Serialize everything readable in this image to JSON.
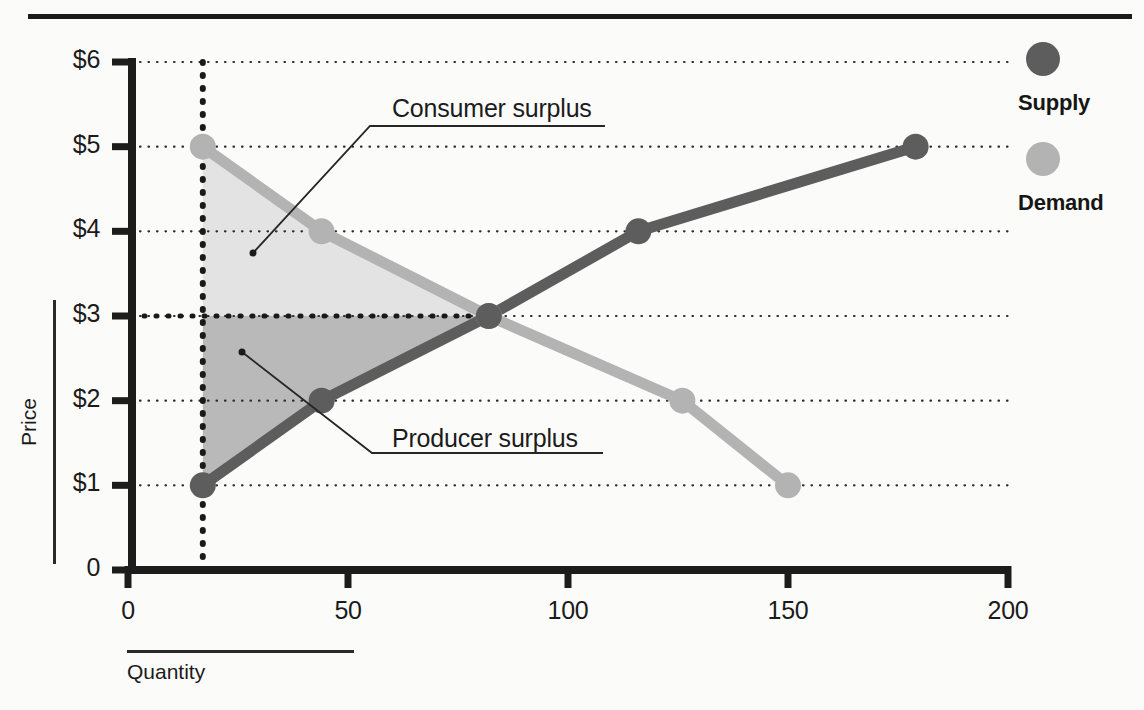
{
  "chart_data": {
    "type": "line",
    "title": "",
    "xlabel": "Quantity",
    "ylabel": "Price",
    "xlim": [
      0,
      200
    ],
    "ylim": [
      0,
      6
    ],
    "xticks": [
      "0",
      "50",
      "100",
      "150",
      "200"
    ],
    "xtick_values": [
      0,
      50,
      100,
      150,
      200
    ],
    "yticks": [
      "0",
      "$1",
      "$2",
      "$3",
      "$4",
      "$5",
      "$6"
    ],
    "ytick_values": [
      0,
      1,
      2,
      3,
      4,
      5,
      6
    ],
    "grid": "horizontal-dotted",
    "legend_position": "right",
    "series": [
      {
        "name": "Supply",
        "color": "#5d5d5d",
        "points": [
          {
            "q": 17,
            "p": 1
          },
          {
            "q": 44,
            "p": 2
          },
          {
            "q": 82,
            "p": 3
          },
          {
            "q": 116,
            "p": 4
          },
          {
            "q": 179,
            "p": 5
          }
        ]
      },
      {
        "name": "Demand",
        "color": "#b3b3b3",
        "points": [
          {
            "q": 17,
            "p": 5
          },
          {
            "q": 44,
            "p": 4
          },
          {
            "q": 82,
            "p": 3
          },
          {
            "q": 126,
            "p": 2
          },
          {
            "q": 150,
            "p": 1
          }
        ]
      }
    ],
    "equilibrium": {
      "q": 82,
      "p": 3
    },
    "regions": [
      {
        "name": "Consumer surplus",
        "color": "#e3e3e3"
      },
      {
        "name": "Producer surplus",
        "color": "#b9b9b9"
      }
    ],
    "reference_lines": [
      {
        "name": "equilibrium-price-line",
        "orientation": "horizontal",
        "value": 3,
        "style": "dotted"
      },
      {
        "name": "left-boundary-line",
        "orientation": "vertical",
        "value": 17,
        "style": "dotted"
      }
    ]
  },
  "annotations": {
    "consumer_surplus": "Consumer surplus",
    "producer_surplus": "Producer surplus"
  },
  "axes": {
    "y_label": "Price",
    "x_label": "Quantity",
    "y_ticks": [
      "$6",
      "$5",
      "$4",
      "$3",
      "$2",
      "$1",
      "0"
    ],
    "x_ticks": [
      "0",
      "50",
      "100",
      "150",
      "200"
    ]
  },
  "legend": {
    "items": [
      {
        "label": "Supply",
        "color": "#5d5d5d",
        "swatch": "filled-circle-icon"
      },
      {
        "label": "Demand",
        "color": "#b3b3b3",
        "swatch": "filled-circle-icon"
      }
    ]
  }
}
